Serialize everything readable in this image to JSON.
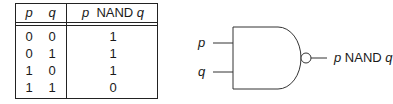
{
  "truth_table": {
    "headers": {
      "p": "p",
      "q": "q",
      "result_var_p": "p",
      "result_op": "NAND",
      "result_var_q": "q"
    },
    "rows": [
      {
        "p": "0",
        "q": "0",
        "out": "1"
      },
      {
        "p": "0",
        "q": "1",
        "out": "1"
      },
      {
        "p": "1",
        "q": "0",
        "out": "1"
      },
      {
        "p": "1",
        "q": "1",
        "out": "0"
      }
    ]
  },
  "gate": {
    "input_p": "p",
    "input_q": "q",
    "output_var_p": "p",
    "output_op": "NAND",
    "output_var_q": "q"
  }
}
